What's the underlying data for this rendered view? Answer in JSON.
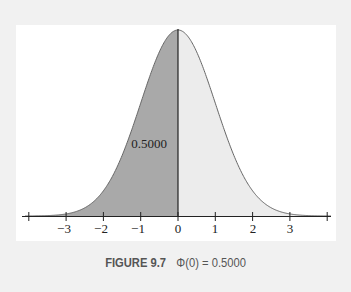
{
  "chart_data": {
    "type": "area",
    "xlabel": "",
    "ylabel": "",
    "x_ticks": [
      -4,
      -3,
      -2,
      -1,
      0,
      1,
      2,
      3,
      4
    ],
    "x_tick_labels": [
      "",
      "−3",
      "−2",
      "−1",
      "0",
      "1",
      "2",
      "3",
      ""
    ],
    "xlim": [
      -4.1,
      4.1
    ],
    "grid": false,
    "series": [
      {
        "name": "standard normal pdf",
        "function": "phi(z) = exp(-z^2/2)/sqrt(2*pi)"
      },
      {
        "name": "shaded area z < 0",
        "value": 0.5,
        "fill": "#a9a9a9"
      },
      {
        "name": "unshaded area z > 0",
        "fill": "#ececec"
      }
    ],
    "annotations": [
      {
        "text": "0.5000",
        "x": -0.6,
        "y_rel": 0.6
      }
    ],
    "colors": {
      "left_fill": "#a9a9a9",
      "right_fill": "#ececec",
      "curve": "#555555",
      "axis": "#222222",
      "background": "#f1f1f1",
      "panel": "#ffffff"
    }
  },
  "annotation_label": "0.5000",
  "caption": {
    "figure": "FIGURE 9.7",
    "text": "Φ(0) = 0.5000"
  },
  "ticks": {
    "m3": "−3",
    "m2": "−2",
    "m1": "−1",
    "z0": "0",
    "p1": "1",
    "p2": "2",
    "p3": "3"
  }
}
